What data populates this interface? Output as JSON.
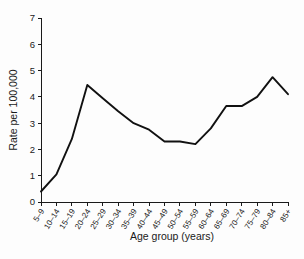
{
  "chart_data": {
    "type": "line",
    "title": "",
    "xlabel": "Age group (years)",
    "ylabel": "Rate per 100,000",
    "categories": [
      "5–9",
      "10–14",
      "15–19",
      "20–24",
      "25–29",
      "30–34",
      "35–39",
      "40–44",
      "45–49",
      "50–54",
      "55–59",
      "60–64",
      "65–69",
      "70–74",
      "75–79",
      "80–84",
      "85+"
    ],
    "values": [
      0.4,
      1.05,
      2.4,
      4.45,
      3.95,
      3.45,
      3.0,
      2.75,
      2.3,
      2.3,
      2.2,
      2.8,
      3.65,
      3.65,
      4.0,
      4.75,
      4.1
    ],
    "series": [
      {
        "name": "Rate per 100,000",
        "values": [
          0.4,
          1.05,
          2.4,
          4.45,
          3.95,
          3.45,
          3.0,
          2.75,
          2.3,
          2.3,
          2.2,
          2.8,
          3.65,
          3.65,
          4.0,
          4.75,
          4.1
        ]
      }
    ],
    "ylim": [
      0,
      7
    ],
    "yticks": [
      0,
      1,
      2,
      3,
      4,
      5,
      6,
      7
    ],
    "ytick_labels": [
      "0",
      "1",
      "2",
      "3",
      "4",
      "5",
      "6",
      "7"
    ],
    "grid": false,
    "legend": false,
    "legend_position": "none",
    "line_color": "#111111",
    "axis_color": "#1a1a1a",
    "background_color": "#ffffff"
  }
}
